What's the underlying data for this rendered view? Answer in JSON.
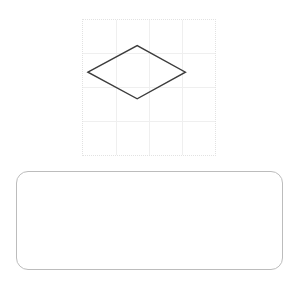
{
  "page": {
    "background_color": "#ffffff",
    "width": 300,
    "height": 283
  },
  "shape_panel": {
    "name": "shape-grid-panel",
    "border_style": "dotted",
    "border_color": "#e2e2e2",
    "background_color": "#ffffff",
    "bounds": {
      "x": 82,
      "y": 19,
      "width": 134,
      "height": 137
    },
    "grid": {
      "visible": true,
      "line_color": "#efefef",
      "columns": 4,
      "rows": 4,
      "vertical_line_x": [
        33.5,
        67,
        100.5
      ],
      "horizontal_line_y": [
        34.25,
        68.5,
        102.75
      ]
    },
    "shape": {
      "type": "rhombus",
      "label": "diamond",
      "stroke_color": "#3c3c3c",
      "stroke_width": 1.4,
      "fill": "none",
      "points_panel_coords": [
        {
          "name": "left-vertex",
          "x": 5,
          "y": 53
        },
        {
          "name": "top-vertex",
          "x": 55,
          "y": 26
        },
        {
          "name": "right-vertex",
          "x": 104,
          "y": 53
        },
        {
          "name": "bottom-vertex",
          "x": 55,
          "y": 80
        }
      ],
      "points_path": "5,53 55,26 104,53 55,80"
    }
  },
  "answer_box": {
    "name": "answer-box",
    "value": "",
    "placeholder": "",
    "border_color": "#bcbcbc",
    "background_color": "#ffffff",
    "corner_radius": 12,
    "bounds": {
      "x": 16,
      "y": 171,
      "width": 267,
      "height": 99
    }
  }
}
